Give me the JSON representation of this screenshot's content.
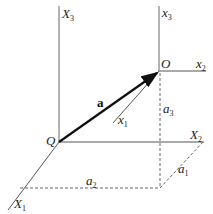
{
  "diagram": {
    "type": "vector-coordinate-frames",
    "colors": {
      "line": "#555555",
      "vector": "#111111",
      "dashed": "#666666",
      "background": "#ffffff"
    },
    "points": {
      "Q": {
        "label": "Q"
      },
      "O": {
        "label": "O"
      }
    },
    "axes": {
      "X3": {
        "main": "X",
        "sub": "3"
      },
      "X2": {
        "main": "X",
        "sub": "2"
      },
      "X1": {
        "main": "X",
        "sub": "1"
      },
      "x3": {
        "main": "x",
        "sub": "3"
      },
      "x2": {
        "main": "x",
        "sub": "2"
      },
      "x1": {
        "main": "x",
        "sub": "1"
      }
    },
    "vector": {
      "label": "a"
    },
    "components": {
      "a1": {
        "main": "a",
        "sub": "1"
      },
      "a2": {
        "main": "a",
        "sub": "2"
      },
      "a3": {
        "main": "a",
        "sub": "3"
      }
    }
  }
}
